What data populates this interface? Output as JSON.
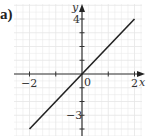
{
  "figure": {
    "part_label": "a)"
  },
  "chart_data": {
    "type": "line",
    "title": "",
    "xlabel": "x",
    "ylabel": "y",
    "function": "y = 2x",
    "series": [
      {
        "name": "y = 2x",
        "x": [
          -2,
          2
        ],
        "y": [
          -4,
          4
        ],
        "color": "#222222"
      }
    ],
    "x_tick_labels": [
      "-2",
      "0",
      "2"
    ],
    "x_ticks": [
      -2,
      -1,
      0,
      1,
      2
    ],
    "y_tick_labels": [
      "4",
      "-3"
    ],
    "y_ticks": [
      -4,
      -3,
      -2,
      -1,
      1,
      2,
      3,
      4
    ],
    "xlim": [
      -2.6,
      2.3
    ],
    "ylim": [
      -4.5,
      5
    ],
    "grid": true,
    "legend": "none"
  },
  "labels": {
    "x_axis": "x",
    "y_axis": "y",
    "origin": "0",
    "x_neg2": "−2",
    "x_pos2": "2",
    "y_pos4": "4",
    "y_neg3": "−3"
  },
  "colors": {
    "grid": "#e6e6e6",
    "axis": "#333333",
    "line": "#222222"
  }
}
